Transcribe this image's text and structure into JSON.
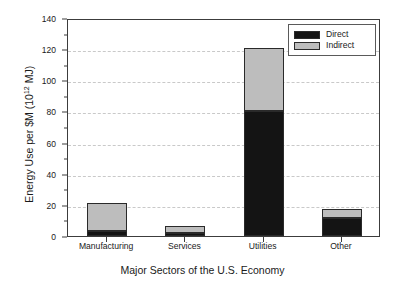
{
  "chart_data": {
    "type": "bar",
    "subtype": "stacked-vertical",
    "title": "",
    "xlabel": "Major Sectors of the U.S. Economy",
    "ylabel": "Energy Use per $M (10^12 MJ)",
    "ylabel_prefix": "Energy Use per $M (10",
    "ylabel_exponent": "12",
    "ylabel_suffix": " MJ)",
    "categories": [
      "Manufacturing",
      "Services",
      "Utilities",
      "Other"
    ],
    "series": [
      {
        "name": "Direct",
        "color": "#141414",
        "values": [
          3,
          2,
          80,
          11.5
        ]
      },
      {
        "name": "Indirect",
        "color": "#bdbdbd",
        "values": [
          18.5,
          4.5,
          41,
          6
        ]
      }
    ],
    "totals": [
      21.5,
      6.5,
      121,
      17.5
    ],
    "ylim": [
      0,
      140
    ],
    "ytick_values": [
      0,
      20,
      40,
      60,
      80,
      100,
      120,
      140
    ],
    "ytick_labels": [
      "0",
      "20",
      "40",
      "60",
      "80",
      "100",
      "120",
      "140"
    ],
    "yminor_tick_values": [
      10,
      30,
      50,
      70,
      90,
      110,
      130
    ],
    "grid": true,
    "grid_axis": "y",
    "grid_style": "dashed",
    "grid_color": "#c9c9c9",
    "legend_position": "top-right",
    "legend_entries": [
      "Direct",
      "Indirect"
    ],
    "axis_color": "#3c3c3c",
    "background": "#ffffff"
  }
}
